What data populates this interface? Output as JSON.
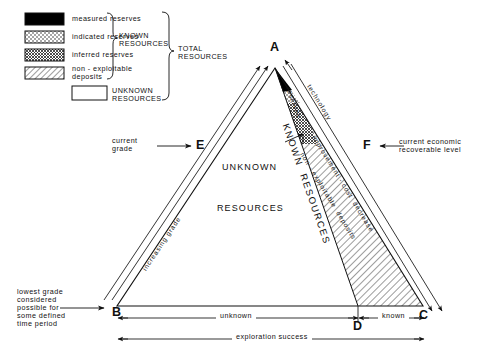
{
  "figure": {
    "type": "mineral-resource-classification-triangle",
    "legend": {
      "entries": [
        {
          "id": "measured",
          "label": "measured reserves",
          "pattern": "solid-black"
        },
        {
          "id": "indicated",
          "label": "indicated reserves",
          "pattern": "stipple-dots"
        },
        {
          "id": "inferred",
          "label": "inferred reserves",
          "pattern": "dense-crosshatch"
        },
        {
          "id": "nonexploitable",
          "label": "non - exploitable\ndeposits",
          "pattern": "diagonal-hatch"
        },
        {
          "id": "unknown",
          "label": "UNKNOWN\nRESOURCES",
          "pattern": "empty-white"
        }
      ],
      "bracket_known": "KNOWN\nRESOURCES",
      "bracket_total": "TOTAL\nRESOURCES"
    },
    "vertices": [
      {
        "id": "A",
        "label": "A",
        "x": 275,
        "y": 48
      },
      {
        "id": "B",
        "label": "B",
        "x": 117,
        "y": 313
      },
      {
        "id": "C",
        "label": "C",
        "x": 423,
        "y": 316
      },
      {
        "id": "D",
        "label": "D",
        "x": 358,
        "y": 327
      },
      {
        "id": "E",
        "label": "E",
        "x": 201,
        "y": 146
      },
      {
        "id": "F",
        "label": "F",
        "x": 368,
        "y": 146
      }
    ],
    "interior_labels": [
      {
        "id": "unknown-resources",
        "line1": "UNKNOWN",
        "line2": "RESOURCES"
      },
      {
        "id": "known-resources",
        "text": "KNOWN  RESOURCES"
      }
    ],
    "annotations": {
      "current_grade": "current\ngrade",
      "lowest_grade": "lowest grade\nconsidered\npossible for\nsome defined\ntime period",
      "current_economic": "current economic\nrecoverable level",
      "increasing_grade": "increasing grade",
      "reserves": "reserves",
      "technology": "technology",
      "improvement_cost": "improvement - cost  decrease",
      "non_exploitable_deposits": "non - exploitable  deposits",
      "unknown_span": "unknown",
      "known_span": "known",
      "exploration_success": "exploration success"
    },
    "colors": {
      "ink": "#111111",
      "paper": "#ffffff",
      "measured_fill": "#000000"
    }
  }
}
